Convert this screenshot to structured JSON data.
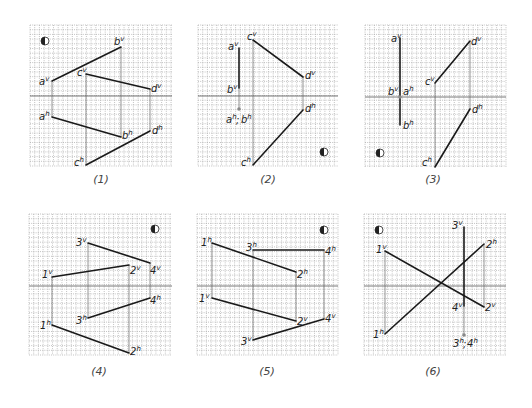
{
  "figure": {
    "grid_step": 4.7,
    "colors": {
      "line": "#1a1a1a",
      "grid": "#9a9a9a",
      "axis": "#555555",
      "projection": "#666666",
      "text": "#222222"
    },
    "symbol_icon": "half-filled-circle-icon",
    "panels": [
      {
        "id": "1",
        "caption": "(1)",
        "box": [
          30,
          25,
          142,
          141
        ],
        "axis_y": 96,
        "caption_pos": [
          101,
          183
        ],
        "symbol": [
          45,
          41
        ],
        "segments": [
          {
            "from": [
              52,
              81
            ],
            "to": [
              121,
              47
            ]
          },
          {
            "from": [
              86,
              74
            ],
            "to": [
              150,
              89
            ]
          },
          {
            "from": [
              52,
              117
            ],
            "to": [
              121,
              137
            ]
          },
          {
            "from": [
              86,
              165
            ],
            "to": [
              150,
              131
            ]
          }
        ],
        "projectors": [
          {
            "x": 52,
            "y1": 81,
            "y2": 117
          },
          {
            "x": 121,
            "y1": 47,
            "y2": 137
          },
          {
            "x": 86,
            "y1": 74,
            "y2": 165
          },
          {
            "x": 150,
            "y1": 89,
            "y2": 131
          }
        ],
        "labels": [
          {
            "base": "a",
            "sup": "v",
            "x": 39,
            "y": 85
          },
          {
            "base": "b",
            "sup": "v",
            "x": 114,
            "y": 45
          },
          {
            "base": "c",
            "sup": "v",
            "x": 77,
            "y": 76
          },
          {
            "base": "d",
            "sup": "v",
            "x": 151,
            "y": 92
          },
          {
            "base": "a",
            "sup": "h",
            "x": 39,
            "y": 120
          },
          {
            "base": "b",
            "sup": "h",
            "x": 122,
            "y": 139
          },
          {
            "base": "c",
            "sup": "h",
            "x": 74,
            "y": 166
          },
          {
            "base": "d",
            "sup": "h",
            "x": 152,
            "y": 134
          }
        ]
      },
      {
        "id": "2",
        "caption": "(2)",
        "box": [
          198,
          25,
          140,
          141
        ],
        "axis_y": 96,
        "caption_pos": [
          268,
          183
        ],
        "symbol": [
          324,
          152
        ],
        "segments": [
          {
            "from": [
              239,
              48
            ],
            "to": [
              239,
              88
            ]
          },
          {
            "from": [
              253,
              40
            ],
            "to": [
              303,
              77
            ]
          },
          {
            "from": [
              303,
              110
            ],
            "to": [
              253,
              165
            ]
          }
        ],
        "projectors": [
          {
            "x": 239,
            "y1": 88,
            "y2": 109
          },
          {
            "x": 253,
            "y1": 40,
            "y2": 165
          },
          {
            "x": 303,
            "y1": 77,
            "y2": 110
          }
        ],
        "points": [
          [
            239,
            109
          ]
        ],
        "labels": [
          {
            "base": "a",
            "sup": "v",
            "x": 228,
            "y": 50
          },
          {
            "base": "b",
            "sup": "v",
            "x": 227,
            "y": 93
          },
          {
            "base": "c",
            "sup": "v",
            "x": 247,
            "y": 40
          },
          {
            "base": "d",
            "sup": "v",
            "x": 305,
            "y": 79
          },
          {
            "base": "a",
            "sup": "h",
            "x": 226,
            "y": 123
          },
          {
            "base": "b",
            "sup": "h",
            "x": 241,
            "y": 123
          },
          {
            "base": "d",
            "sup": "h",
            "x": 305,
            "y": 112
          },
          {
            "base": "c",
            "sup": "h",
            "x": 241,
            "y": 166
          }
        ],
        "separators": [
          {
            "text": ";",
            "x": 236,
            "y": 123
          }
        ]
      },
      {
        "id": "3",
        "caption": "(3)",
        "box": [
          365,
          25,
          141,
          142
        ],
        "axis_y": 97,
        "caption_pos": [
          433,
          183
        ],
        "symbol": [
          380,
          153
        ],
        "segments": [
          {
            "from": [
              400,
              38
            ],
            "to": [
              400,
              125
            ]
          },
          {
            "from": [
              435,
              83
            ],
            "to": [
              470,
              41
            ]
          },
          {
            "from": [
              470,
              109
            ],
            "to": [
              435,
              167
            ]
          }
        ],
        "projectors": [
          {
            "x": 435,
            "y1": 83,
            "y2": 167
          },
          {
            "x": 470,
            "y1": 41,
            "y2": 109
          }
        ],
        "points": [
          [
            400,
            97
          ]
        ],
        "labels": [
          {
            "base": "a",
            "sup": "v",
            "x": 391,
            "y": 42
          },
          {
            "base": "b",
            "sup": "v",
            "x": 388,
            "y": 95
          },
          {
            "base": "a",
            "sup": "h",
            "x": 403,
            "y": 95
          },
          {
            "base": "b",
            "sup": "h",
            "x": 403,
            "y": 129
          },
          {
            "base": "c",
            "sup": "v",
            "x": 425,
            "y": 85
          },
          {
            "base": "d",
            "sup": "v",
            "x": 471,
            "y": 45
          },
          {
            "base": "d",
            "sup": "h",
            "x": 472,
            "y": 113
          },
          {
            "base": "c",
            "sup": "h",
            "x": 422,
            "y": 166
          }
        ]
      },
      {
        "id": "4",
        "caption": "(4)",
        "box": [
          29,
          214,
          143,
          141
        ],
        "axis_y": 286,
        "caption_pos": [
          99,
          375
        ],
        "symbol": [
          155,
          229
        ],
        "segments": [
          {
            "from": [
              52,
              277
            ],
            "to": [
              129,
              265
            ]
          },
          {
            "from": [
              88,
              243
            ],
            "to": [
              150,
              263
            ]
          },
          {
            "from": [
              88,
              318
            ],
            "to": [
              150,
              298
            ]
          },
          {
            "from": [
              52,
              325
            ],
            "to": [
              129,
              353
            ]
          }
        ],
        "projectors": [
          {
            "x": 52,
            "y1": 277,
            "y2": 325
          },
          {
            "x": 129,
            "y1": 265,
            "y2": 353
          },
          {
            "x": 88,
            "y1": 243,
            "y2": 318
          },
          {
            "x": 150,
            "y1": 263,
            "y2": 298
          }
        ],
        "labels": [
          {
            "base": "1",
            "sup": "v",
            "x": 42,
            "y": 278
          },
          {
            "base": "2",
            "sup": "v",
            "x": 130,
            "y": 274
          },
          {
            "base": "3",
            "sup": "v",
            "x": 76,
            "y": 246
          },
          {
            "base": "4",
            "sup": "v",
            "x": 150,
            "y": 274
          },
          {
            "base": "1",
            "sup": "h",
            "x": 40,
            "y": 329
          },
          {
            "base": "2",
            "sup": "h",
            "x": 130,
            "y": 355
          },
          {
            "base": "3",
            "sup": "h",
            "x": 76,
            "y": 324
          },
          {
            "base": "4",
            "sup": "h",
            "x": 150,
            "y": 304
          }
        ]
      },
      {
        "id": "5",
        "caption": "(5)",
        "box": [
          197,
          214,
          141,
          141
        ],
        "axis_y": 286,
        "caption_pos": [
          267,
          375
        ],
        "symbol": [
          324,
          230
        ],
        "segments": [
          {
            "from": [
              212,
              243
            ],
            "to": [
              296,
              272
            ]
          },
          {
            "from": [
              253,
              250
            ],
            "to": [
              324,
              250
            ]
          },
          {
            "from": [
              212,
              298
            ],
            "to": [
              296,
              321
            ]
          },
          {
            "from": [
              253,
              340
            ],
            "to": [
              324,
              319
            ]
          }
        ],
        "projectors": [
          {
            "x": 212,
            "y1": 243,
            "y2": 298
          },
          {
            "x": 296,
            "y1": 272,
            "y2": 321
          },
          {
            "x": 253,
            "y1": 250,
            "y2": 340
          },
          {
            "x": 324,
            "y1": 250,
            "y2": 319
          }
        ],
        "labels": [
          {
            "base": "1",
            "sup": "h",
            "x": 201,
            "y": 246
          },
          {
            "base": "2",
            "sup": "h",
            "x": 297,
            "y": 278
          },
          {
            "base": "3",
            "sup": "h",
            "x": 246,
            "y": 251
          },
          {
            "base": "4",
            "sup": "h",
            "x": 325,
            "y": 255
          },
          {
            "base": "1",
            "sup": "v",
            "x": 199,
            "y": 302
          },
          {
            "base": "2",
            "sup": "v",
            "x": 297,
            "y": 325
          },
          {
            "base": "3",
            "sup": "v",
            "x": 241,
            "y": 345
          },
          {
            "base": "4",
            "sup": "v",
            "x": 325,
            "y": 322
          }
        ]
      },
      {
        "id": "6",
        "caption": "(6)",
        "box": [
          364,
          214,
          142,
          141
        ],
        "axis_y": 286,
        "caption_pos": [
          433,
          375
        ],
        "symbol": [
          379,
          230
        ],
        "segments": [
          {
            "from": [
              385,
              251
            ],
            "to": [
              484,
              307
            ]
          },
          {
            "from": [
              385,
              334
            ],
            "to": [
              484,
              244
            ]
          },
          {
            "from": [
              464,
              227
            ],
            "to": [
              464,
              306
            ]
          }
        ],
        "projectors": [
          {
            "x": 385,
            "y1": 251,
            "y2": 334
          },
          {
            "x": 484,
            "y1": 244,
            "y2": 307
          },
          {
            "x": 464,
            "y1": 306,
            "y2": 335
          }
        ],
        "points": [
          [
            464,
            335
          ]
        ],
        "labels": [
          {
            "base": "1",
            "sup": "v",
            "x": 376,
            "y": 253
          },
          {
            "base": "2",
            "sup": "v",
            "x": 485,
            "y": 311
          },
          {
            "base": "3",
            "sup": "v",
            "x": 452,
            "y": 229
          },
          {
            "base": "4",
            "sup": "v",
            "x": 452,
            "y": 311
          },
          {
            "base": "1",
            "sup": "h",
            "x": 373,
            "y": 338
          },
          {
            "base": "2",
            "sup": "h",
            "x": 486,
            "y": 248
          },
          {
            "base": "3",
            "sup": "h",
            "x": 453,
            "y": 347
          },
          {
            "base": "4",
            "sup": "h",
            "x": 467,
            "y": 347
          }
        ],
        "separators": [
          {
            "text": ";",
            "x": 463,
            "y": 347
          }
        ]
      }
    ]
  }
}
